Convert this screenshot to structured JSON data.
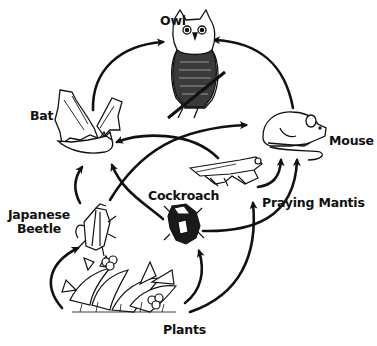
{
  "diagram": {
    "type": "food-web",
    "colors": {
      "ink": "#111111",
      "background": "#ffffff",
      "fill_light": "#ffffff",
      "fill_dark": "#222222"
    },
    "nodes": {
      "owl": {
        "label": "Owl"
      },
      "bat": {
        "label": "Bat"
      },
      "mouse": {
        "label": "Mouse"
      },
      "cockroach": {
        "label": "Cockroach"
      },
      "praying_mantis": {
        "label": "Praying Mantis"
      },
      "japanese_beetle": {
        "label_line1": "Japanese",
        "label_line2": "Beetle"
      },
      "plants": {
        "label": "Plants"
      }
    },
    "edges": [
      {
        "from": "Bat",
        "to": "Owl"
      },
      {
        "from": "Mouse",
        "to": "Owl"
      },
      {
        "from": "Japanese Beetle",
        "to": "Bat"
      },
      {
        "from": "Japanese Beetle",
        "to": "Mouse"
      },
      {
        "from": "Cockroach",
        "to": "Bat"
      },
      {
        "from": "Cockroach",
        "to": "Mouse"
      },
      {
        "from": "Praying Mantis",
        "to": "Bat"
      },
      {
        "from": "Praying Mantis",
        "to": "Mouse"
      },
      {
        "from": "Plants",
        "to": "Japanese Beetle"
      },
      {
        "from": "Plants",
        "to": "Cockroach"
      },
      {
        "from": "Plants",
        "to": "Praying Mantis"
      }
    ]
  }
}
